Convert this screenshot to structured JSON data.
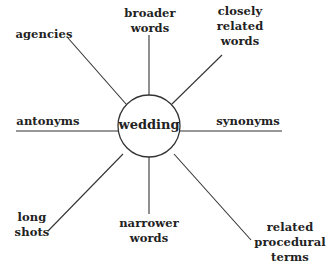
{
  "diagram": {
    "type": "radial-concept-map",
    "line_color": "#333333",
    "background": "#ffffff",
    "hub": {
      "label": "wedding",
      "center": [
        149,
        126
      ],
      "radius": 31
    },
    "spokes": [
      {
        "id": "broader-words",
        "lines": [
          "broader",
          "words"
        ],
        "from": [
          149,
          95
        ],
        "to": [
          149,
          35
        ]
      },
      {
        "id": "closely-related-words",
        "lines": [
          "closely",
          "related",
          "words"
        ],
        "from": [
          172,
          104
        ],
        "to": [
          222,
          55
        ]
      },
      {
        "id": "agencies",
        "lines": [
          "agencies"
        ],
        "from": [
          126,
          104
        ],
        "to": [
          68,
          38
        ]
      },
      {
        "id": "antonyms",
        "lines": [
          "antonyms"
        ],
        "from": [
          118,
          131
        ],
        "to": [
          16,
          131
        ]
      },
      {
        "id": "synonyms",
        "lines": [
          "synonyms"
        ],
        "from": [
          180,
          131
        ],
        "to": [
          282,
          131
        ]
      },
      {
        "id": "long-shots",
        "lines": [
          "long",
          "shots"
        ],
        "from": [
          123,
          154
        ],
        "to": [
          48,
          231
        ]
      },
      {
        "id": "narrower-words",
        "lines": [
          "narrower",
          "words"
        ],
        "from": [
          149,
          157
        ],
        "to": [
          149,
          214
        ]
      },
      {
        "id": "related-procedural-terms",
        "lines": [
          "related",
          "procedural",
          "terms"
        ],
        "from": [
          174,
          154
        ],
        "to": [
          251,
          240
        ]
      }
    ]
  }
}
